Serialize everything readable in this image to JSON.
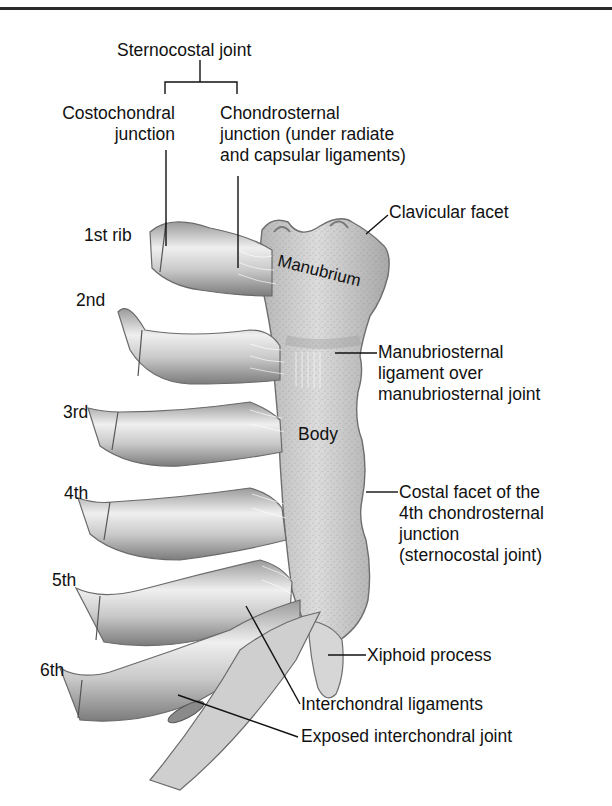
{
  "figure": {
    "colors": {
      "ink": "#111111",
      "bone_light": "#e6e6e6",
      "bone_mid": "#b8b8b8",
      "bone_dark": "#7a7a7a",
      "background": "#ffffff"
    }
  },
  "labels": {
    "sternocostal_joint": "Sternocostal joint",
    "costochondral": [
      "Costochondral",
      "junction"
    ],
    "chondrosternal": [
      "Chondrosternal",
      "junction (under radiate",
      "and capsular ligaments)"
    ],
    "clavicular_facet": "Clavicular facet",
    "manubrium": "Manubrium",
    "manubriosternal": [
      "Manubriosternal",
      "ligament over",
      "manubriosternal joint"
    ],
    "body": "Body",
    "costal_facet": [
      "Costal facet of the",
      "4th chondrosternal",
      "junction",
      "(sternocostal joint)"
    ],
    "xiphoid": "Xiphoid process",
    "interchondral_ligaments": "Interchondral ligaments",
    "exposed_interchondral": "Exposed interchondral joint"
  },
  "ribs": [
    {
      "label": "1st rib"
    },
    {
      "label": "2nd"
    },
    {
      "label": "3rd"
    },
    {
      "label": "4th"
    },
    {
      "label": "5th"
    },
    {
      "label": "6th"
    }
  ]
}
